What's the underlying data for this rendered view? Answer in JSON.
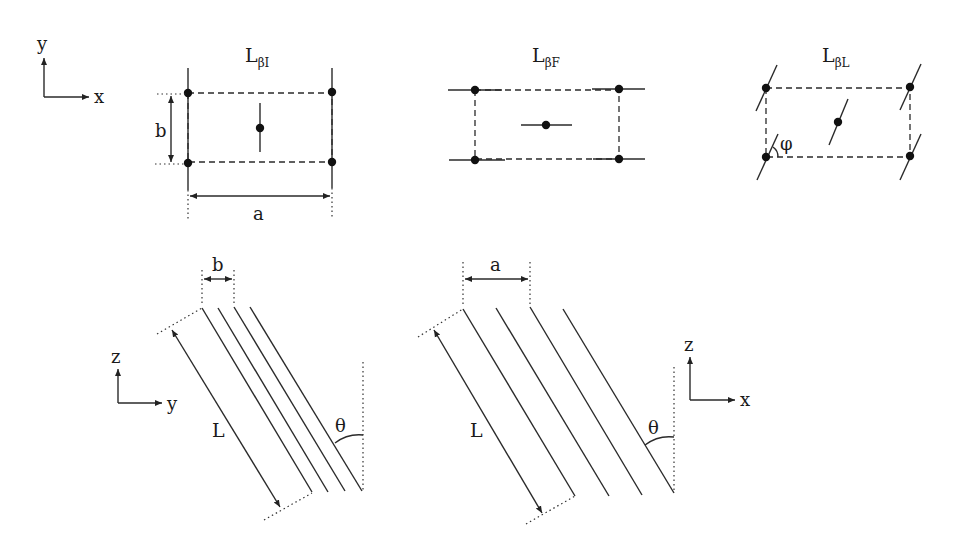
{
  "panels": {
    "lbi": {
      "title_main": "L",
      "title_sub": "βI",
      "label_a": "a",
      "label_b": "b"
    },
    "lbf": {
      "title_main": "L",
      "title_sub": "βF"
    },
    "lbl": {
      "title_main": "L",
      "title_sub": "βL",
      "angle_label": "φ"
    },
    "side_yz": {
      "label_width": "b",
      "label_length": "L",
      "angle_label": "θ"
    },
    "side_xz": {
      "label_width": "a",
      "label_length": "L",
      "angle_label": "θ"
    }
  },
  "axes": {
    "top": {
      "vertical": "y",
      "horizontal": "x"
    },
    "bottom_left": {
      "vertical": "z",
      "horizontal": "y"
    },
    "bottom_right": {
      "vertical": "z",
      "horizontal": "x"
    }
  },
  "colors": {
    "ink": "#2a2a2a",
    "background": "#ffffff"
  }
}
